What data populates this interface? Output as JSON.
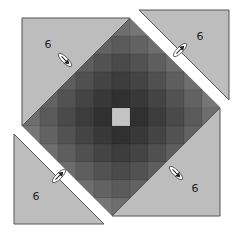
{
  "canvas": {
    "width": 241,
    "height": 237,
    "background": "#ffffff"
  },
  "grid": {
    "x": 22,
    "y": 18,
    "cell": 18,
    "size": 11,
    "center_color": "#c4c4c4",
    "shade_levels": [
      [
        40,
        48,
        60,
        74,
        90,
        110
      ],
      [
        48,
        56,
        68,
        82,
        98,
        118
      ],
      [
        60,
        68,
        80,
        94,
        110,
        130
      ],
      [
        74,
        82,
        94,
        108,
        124,
        144
      ],
      [
        90,
        98,
        110,
        124,
        140,
        160
      ],
      [
        110,
        118,
        130,
        144,
        160,
        180
      ]
    ]
  },
  "colors": {
    "triangle_fill": "#bdbdbd",
    "triangle_stroke": "#555555",
    "diagonal_line": "#333333",
    "gap": "#ffffff",
    "marker_fill": "#ffffff",
    "marker_stroke": "#444444"
  },
  "corners": [
    {
      "id": "top-left",
      "label": "6",
      "points": "22,18 130,18 22,126",
      "label_x": 48,
      "label_y": 48,
      "detached": false
    },
    {
      "id": "top-right",
      "label": "6",
      "points": "139,10 229,10 229,100",
      "label_x": 200,
      "label_y": 40,
      "detached": true
    },
    {
      "id": "bottom-left",
      "label": "6",
      "points": "14,134 14,224 104,224",
      "label_x": 36,
      "label_y": 200,
      "detached": true
    },
    {
      "id": "bottom-right",
      "label": "6",
      "points": "220,108 220,216 112,216",
      "label_x": 195,
      "label_y": 192,
      "detached": false
    }
  ],
  "markers": [
    {
      "id": "marker-top-left",
      "cx": 65,
      "cy": 60,
      "angle": 45
    },
    {
      "id": "marker-top-right",
      "cx": 180,
      "cy": 50,
      "angle": -45
    },
    {
      "id": "marker-bottom-left",
      "cx": 59,
      "cy": 176,
      "angle": -45
    },
    {
      "id": "marker-bottom-right",
      "cx": 176,
      "cy": 173,
      "angle": 45
    }
  ]
}
